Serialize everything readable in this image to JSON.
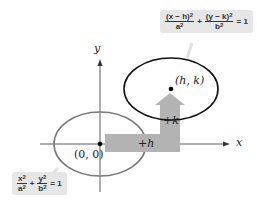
{
  "diagram": {
    "axes": {
      "x_label": "x",
      "y_label": "y"
    },
    "origin_label": "(0, 0)",
    "center_label": "(h, k)",
    "shift_h_label": "+h",
    "shift_k_label": "+k",
    "colors": {
      "gray_ellipse": "#7a7a7a",
      "black_ellipse": "#111111",
      "arrow": "#b3b3b3",
      "callout_bg": "#e6e6e6"
    },
    "equation_translated": {
      "term1_num": "(x − h)",
      "term1_den": "a",
      "plus": "+",
      "term2_num": "(y − k)",
      "term2_den": "b",
      "rhs": "= 1"
    },
    "equation_standard": {
      "term1_num": "x",
      "term1_den": "a",
      "plus": "+",
      "term2_num": "y",
      "term2_den": "b",
      "rhs": "= 1"
    },
    "exp": "2"
  }
}
